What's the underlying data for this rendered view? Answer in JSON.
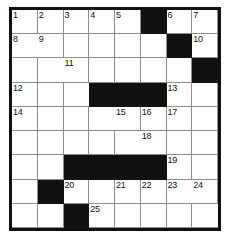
{
  "puzzle": {
    "type": "crossword-grid",
    "columns": 8,
    "rows": 9,
    "colors": {
      "block": "#111111",
      "background": "#ffffff",
      "grid_line": "#8d8d8d",
      "border": "#111111",
      "number_text": "#111111"
    },
    "cells": [
      [
        {
          "block": false,
          "number": "1"
        },
        {
          "block": false,
          "number": "2"
        },
        {
          "block": false,
          "number": "3"
        },
        {
          "block": false,
          "number": "4"
        },
        {
          "block": false,
          "number": "5"
        },
        {
          "block": true,
          "number": ""
        },
        {
          "block": false,
          "number": "6"
        },
        {
          "block": false,
          "number": "7"
        },
        {
          "block": false,
          "number": "8"
        }
      ],
      [
        {
          "block": false,
          "number": "9"
        },
        {
          "block": false,
          "number": ""
        },
        {
          "block": false,
          "number": ""
        },
        {
          "block": false,
          "number": ""
        },
        {
          "block": false,
          "number": ""
        },
        {
          "block": true,
          "number": ""
        },
        {
          "block": false,
          "number": "10"
        },
        {
          "block": false,
          "number": ""
        },
        {
          "block": false,
          "number": ""
        }
      ],
      [
        {
          "block": false,
          "number": "11"
        },
        {
          "block": false,
          "number": ""
        },
        {
          "block": false,
          "number": ""
        },
        {
          "block": false,
          "number": ""
        },
        {
          "block": false,
          "number": ""
        },
        {
          "block": true,
          "number": ""
        },
        {
          "block": false,
          "number": "12"
        },
        {
          "block": false,
          "number": ""
        },
        {
          "block": false,
          "number": ""
        }
      ],
      [
        {
          "block": true,
          "number": ""
        },
        {
          "block": true,
          "number": ""
        },
        {
          "block": true,
          "number": ""
        },
        {
          "block": false,
          "number": "13"
        },
        {
          "block": false,
          "number": ""
        },
        {
          "block": false,
          "number": "14"
        },
        {
          "block": false,
          "number": ""
        },
        {
          "block": false,
          "number": ""
        },
        {
          "block": false,
          "number": ""
        }
      ],
      [
        {
          "block": false,
          "number": "15"
        },
        {
          "block": false,
          "number": "16"
        },
        {
          "block": false,
          "number": "17"
        },
        {
          "block": false,
          "number": ""
        },
        {
          "block": false,
          "number": ""
        },
        {
          "block": false,
          "number": ""
        },
        {
          "block": false,
          "number": ""
        },
        {
          "block": false,
          "number": ""
        },
        {
          "block": false,
          "number": ""
        }
      ],
      [
        {
          "block": false,
          "number": "18"
        },
        {
          "block": false,
          "number": ""
        },
        {
          "block": false,
          "number": ""
        },
        {
          "block": false,
          "number": ""
        },
        {
          "block": false,
          "number": ""
        },
        {
          "block": true,
          "number": ""
        },
        {
          "block": true,
          "number": ""
        },
        {
          "block": true,
          "number": ""
        },
        {
          "block": true,
          "number": ""
        }
      ],
      [
        {
          "block": false,
          "number": "19"
        },
        {
          "block": false,
          "number": ""
        },
        {
          "block": false,
          "number": ""
        },
        {
          "block": true,
          "number": ""
        },
        {
          "block": false,
          "number": "20"
        },
        {
          "block": false,
          "number": ""
        },
        {
          "block": false,
          "number": "21"
        },
        {
          "block": false,
          "number": "22"
        },
        {
          "block": false,
          "number": "23"
        }
      ],
      [
        {
          "block": false,
          "number": "24"
        },
        {
          "block": false,
          "number": ""
        },
        {
          "block": false,
          "number": ""
        },
        {
          "block": true,
          "number": ""
        },
        {
          "block": false,
          "number": "25"
        },
        {
          "block": false,
          "number": ""
        },
        {
          "block": false,
          "number": ""
        },
        {
          "block": false,
          "number": ""
        },
        {
          "block": false,
          "number": ""
        }
      ],
      [
        {
          "block": false,
          "number": "26"
        },
        {
          "block": false,
          "number": ""
        },
        {
          "block": false,
          "number": ""
        },
        {
          "block": true,
          "number": ""
        },
        {
          "block": false,
          "number": "27"
        },
        {
          "block": false,
          "number": ""
        },
        {
          "block": false,
          "number": ""
        },
        {
          "block": false,
          "number": ""
        },
        {
          "block": false,
          "number": ""
        }
      ]
    ]
  }
}
